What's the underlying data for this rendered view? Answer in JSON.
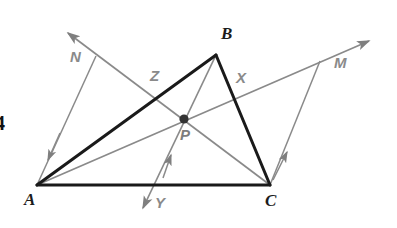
{
  "diagram": {
    "type": "euclidean-geometry-figure",
    "canvas": {
      "width": 397,
      "height": 228,
      "background": "#ffffff"
    },
    "colors": {
      "triangle_stroke": "#1a1a1a",
      "ray_stroke": "#8a8a8a",
      "point_fill": "#333333",
      "vertex_label": "#1c1c1c",
      "ray_label": "#8a8a8a"
    },
    "vertices": [
      {
        "name": "A",
        "label": "A",
        "x": 37,
        "y": 185,
        "label_x": 24,
        "label_y": 191
      },
      {
        "name": "B",
        "label": "B",
        "x": 216,
        "y": 55,
        "label_x": 221,
        "label_y": 25
      },
      {
        "name": "C",
        "label": "C",
        "x": 270,
        "y": 185,
        "label_x": 265,
        "label_y": 192
      }
    ],
    "interior_point": {
      "name": "P",
      "label": "P",
      "x": 184,
      "y": 119,
      "label_x": 180,
      "label_y": 127,
      "radius": 4.5
    },
    "ray_labels": [
      {
        "name": "N",
        "label": "N",
        "x": 70,
        "y": 49
      },
      {
        "name": "Z",
        "label": "Z",
        "x": 150,
        "y": 68
      },
      {
        "name": "X",
        "label": "X",
        "x": 236,
        "y": 70
      },
      {
        "name": "M",
        "label": "M",
        "x": 334,
        "y": 55
      },
      {
        "name": "Y",
        "label": "Y",
        "x": 155,
        "y": 195
      }
    ],
    "triangle_sides": [
      {
        "name": "side-AB",
        "from": "A",
        "to": "B",
        "x1": 37,
        "y1": 185,
        "x2": 216,
        "y2": 55
      },
      {
        "name": "side-BC",
        "from": "B",
        "to": "C",
        "x1": 216,
        "y1": 55,
        "x2": 270,
        "y2": 185
      },
      {
        "name": "side-AC",
        "from": "A",
        "to": "C",
        "x1": 37,
        "y1": 185,
        "x2": 270,
        "y2": 185
      }
    ],
    "rays": [
      {
        "name": "ray-A-through-P-to-M",
        "from": "A",
        "through": "P",
        "toward": "M",
        "x1": 37,
        "y1": 185,
        "x2": 373,
        "y2": 38,
        "arrow_at_end": true
      },
      {
        "name": "ray-C-through-P-to-N",
        "from": "C",
        "through": "P",
        "toward": "N",
        "x1": 270,
        "y1": 185,
        "x2": 64,
        "y2": 30,
        "arrow_at_end": true
      },
      {
        "name": "ray-B-through-P-to-Y",
        "from": "B",
        "through": "P",
        "toward": "Y",
        "x1": 216,
        "y1": 55,
        "x2": 141,
        "y2": 212,
        "arrow_at_end": true
      }
    ],
    "parallel_segments": [
      {
        "name": "segment-N-to-A",
        "from_x": 96,
        "from_y": 56,
        "to_x": 37,
        "to_y": 185,
        "arrow_x": 47,
        "arrow_y": 163,
        "tick_arrow": true
      },
      {
        "name": "segment-C-to-M",
        "from_x": 270,
        "from_y": 185,
        "to_x": 319,
        "to_y": 62,
        "arrow_x": 286,
        "arrow_y": 156,
        "tick_arrow": true
      },
      {
        "name": "segment-Y-upper-arrow",
        "from_x": 141,
        "from_y": 212,
        "to_x": 170,
        "to_y": 152,
        "arrow_x": 166,
        "arrow_y": 159,
        "tick_arrow": true
      }
    ],
    "cropped_margin_text": {
      "name": "page-margin-digit",
      "text": "4",
      "x": -4,
      "y": 113
    }
  }
}
